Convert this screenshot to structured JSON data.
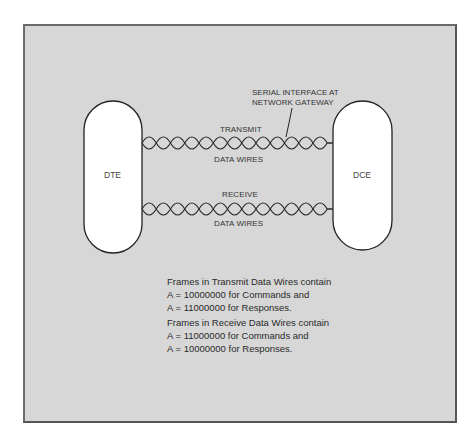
{
  "diagram": {
    "nodes": {
      "dte": {
        "label": "DTE"
      },
      "dce": {
        "label": "DCE"
      }
    },
    "links": {
      "transmit": {
        "top_label": "TRANSMIT",
        "bottom_label": "DATA WIRES"
      },
      "receive": {
        "top_label": "RECEIVE",
        "bottom_label": "DATA WIRES"
      }
    },
    "callout": {
      "line1": "SERIAL INTERFACE AT",
      "line2": "NETWORK GATEWAY"
    },
    "notes": {
      "transmit": [
        "Frames in Transmit Data Wires contain",
        "A  =  10000000 for Commands and",
        "A  =  11000000 for Responses."
      ],
      "receive": [
        "Frames in Receive Data Wires contain",
        "A  =  11000000 for Commands and",
        "A  =  10000000 for Responses."
      ]
    },
    "colors": {
      "background": "#d7d7d7",
      "border": "#555555",
      "node_fill": "#ffffff",
      "line": "#222222"
    }
  }
}
